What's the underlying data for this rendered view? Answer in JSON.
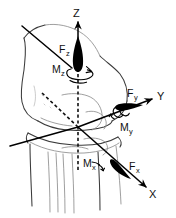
{
  "figure": {
    "background_color": "#ffffff",
    "ink_color": "#111111",
    "bone_outline_color": "#3a3a3a",
    "bone_detail_color": "#8e8e8e",
    "width": 176,
    "height": 218
  },
  "anatomy": {
    "name": "knee-joint",
    "parts": [
      {
        "name": "femur",
        "label": ""
      },
      {
        "name": "femoral-condyles",
        "label": ""
      },
      {
        "name": "patella",
        "label": ""
      },
      {
        "name": "tibia",
        "label": ""
      },
      {
        "name": "fibula",
        "label": ""
      }
    ]
  },
  "coordinate_system": {
    "origin_label": "",
    "axes": [
      {
        "id": "x",
        "label": "X",
        "style": "solid-with-arrowhead",
        "direction": "down-right-anterior"
      },
      {
        "id": "y",
        "label": "Y",
        "style": "solid-with-arrowhead",
        "direction": "right-lateral"
      },
      {
        "id": "z",
        "label": "Z",
        "style": "dashed-with-arrowhead",
        "direction": "up-superior"
      }
    ]
  },
  "forces": [
    {
      "id": "fx",
      "label": "F",
      "subscript": "x",
      "arrow": "solid-teardrop",
      "along_axis": "X"
    },
    {
      "id": "fy",
      "label": "F",
      "subscript": "y",
      "arrow": "solid-teardrop",
      "along_axis": "Y"
    },
    {
      "id": "fz",
      "label": "F",
      "subscript": "z",
      "arrow": "solid-teardrop",
      "along_axis": "Z"
    }
  ],
  "moments": [
    {
      "id": "mx",
      "label": "M",
      "subscript": "x",
      "arrow": "curved-rotation",
      "about_axis": "X"
    },
    {
      "id": "my",
      "label": "M",
      "subscript": "y",
      "arrow": "curved-rotation-coil",
      "about_axis": "Y"
    },
    {
      "id": "mz",
      "label": "M",
      "subscript": "z",
      "arrow": "curved-rotation-ellipse",
      "about_axis": "Z"
    }
  ]
}
